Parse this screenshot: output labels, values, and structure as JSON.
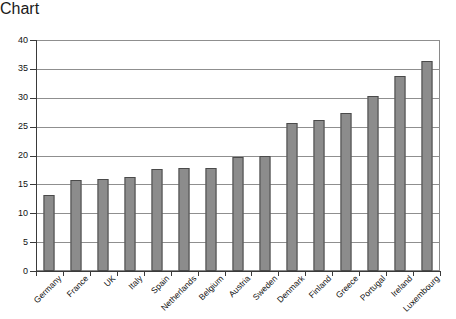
{
  "chart_data": {
    "type": "bar",
    "title": "",
    "subtitle": "",
    "xlabel": "",
    "ylabel": "",
    "categories": [
      "Germany",
      "France",
      "UK",
      "Italy",
      "Spain",
      "Netherlands",
      "Belgium",
      "Austria",
      "Sweden",
      "Denmark",
      "Finland",
      "Greece",
      "Portugal",
      "Ireland",
      "Luxembourg"
    ],
    "values": [
      13.1,
      15.7,
      16.0,
      16.3,
      17.6,
      17.8,
      17.9,
      19.7,
      19.9,
      25.7,
      26.2,
      27.3,
      30.3,
      33.7,
      36.3
    ],
    "ylim": [
      0,
      40
    ],
    "ytick_step": 5,
    "ytick_labels": [
      "0",
      "5",
      "10",
      "15",
      "20",
      "25",
      "30",
      "35",
      "40"
    ],
    "grid": true,
    "grid_orientation": "horizontal",
    "legend": false,
    "legend_position": "none",
    "annotations": [],
    "bar_color": "#8c8c8c",
    "bar_edge_color": "#4a4a4a",
    "axis_color": "#3a3a3a",
    "grid_color": "#8f8f8f",
    "background_color": "#ffffff",
    "xtick_label_rotation": -45
  }
}
